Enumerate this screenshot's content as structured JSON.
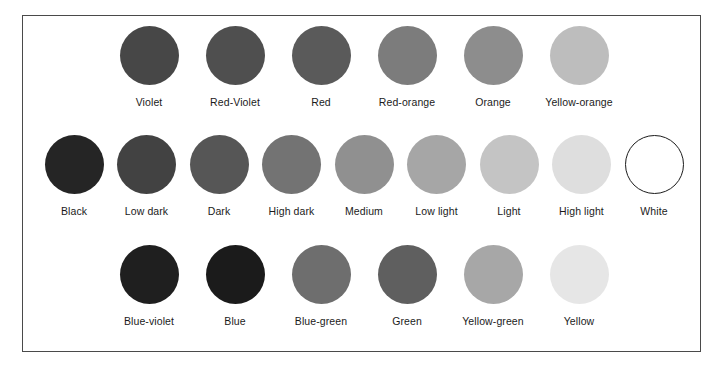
{
  "figure": {
    "background_color": "#ffffff",
    "frame_color": "#4a4a4a",
    "label_color": "#1b1b1b"
  },
  "rows": {
    "warm_hues": {
      "name": "warm-hues-row",
      "swatches": [
        {
          "label": "Violet",
          "color": "#474747",
          "outlined": false
        },
        {
          "label": "Red-Violet",
          "color": "#4f4f4f",
          "outlined": false
        },
        {
          "label": "Red",
          "color": "#5a5a5a",
          "outlined": false
        },
        {
          "label": "Red-orange",
          "color": "#7c7c7c",
          "outlined": false
        },
        {
          "label": "Orange",
          "color": "#8d8d8d",
          "outlined": false
        },
        {
          "label": "Yellow-orange",
          "color": "#bdbdbd",
          "outlined": false
        }
      ]
    },
    "value_scale": {
      "name": "neutral-value-scale-row",
      "swatches": [
        {
          "label": "Black",
          "color": "#252525",
          "outlined": false
        },
        {
          "label": "Low dark",
          "color": "#424242",
          "outlined": false
        },
        {
          "label": "Dark",
          "color": "#565656",
          "outlined": false
        },
        {
          "label": "High dark",
          "color": "#737373",
          "outlined": false
        },
        {
          "label": "Medium",
          "color": "#909090",
          "outlined": false
        },
        {
          "label": "Low light",
          "color": "#a6a6a6",
          "outlined": false
        },
        {
          "label": "Light",
          "color": "#c4c4c4",
          "outlined": false
        },
        {
          "label": "High light",
          "color": "#dedede",
          "outlined": false
        },
        {
          "label": "White",
          "color": "#ffffff",
          "outlined": true
        }
      ]
    },
    "cool_hues": {
      "name": "cool-hues-row",
      "swatches": [
        {
          "label": "Blue-violet",
          "color": "#1f1f1f",
          "outlined": false
        },
        {
          "label": "Blue",
          "color": "#1b1b1b",
          "outlined": false
        },
        {
          "label": "Blue-green",
          "color": "#6e6e6e",
          "outlined": false
        },
        {
          "label": "Green",
          "color": "#5f5f5f",
          "outlined": false
        },
        {
          "label": "Yellow-green",
          "color": "#a7a7a7",
          "outlined": false
        },
        {
          "label": "Yellow",
          "color": "#e6e6e6",
          "outlined": false
        }
      ]
    }
  }
}
